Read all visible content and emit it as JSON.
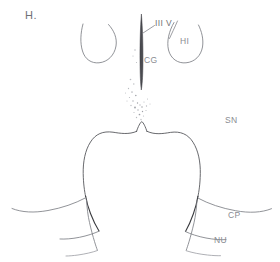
{
  "figure": {
    "panel_letter": "H.",
    "background_color": "#ffffff",
    "ink_color": "#57585c",
    "label_color": "#8a8c92",
    "width": 280,
    "height": 262,
    "medium": "hand-drawn line diagram"
  },
  "labels": {
    "third_ventricle": "III V",
    "cingulate_gyrus": "CG",
    "hippocampus": "HI",
    "substantia_nigra": "SN",
    "cerebral_peduncle": "CP",
    "nucleus": "NU"
  }
}
